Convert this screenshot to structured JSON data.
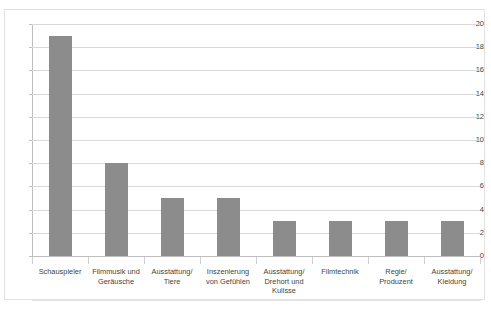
{
  "chart_data": {
    "type": "bar",
    "title": "",
    "xlabel": "",
    "ylabel": "",
    "ylim": [
      0,
      20
    ],
    "yticks": [
      0,
      2,
      4,
      6,
      8,
      10,
      12,
      14,
      16,
      18,
      20
    ],
    "grid": true,
    "legend": false,
    "bar_color": "#8c8c8c",
    "categories": [
      "Schauspieler",
      "Filmmusik und\nGeräusche",
      "Ausstattung/\nTiere",
      "Inszenierung\nvon Gefühlen",
      "Ausstattung/\nDrehort und\nKulisse",
      "Filmtechnik",
      "Regie/\nProduzent",
      "Ausstattung/\nKleidung"
    ],
    "values": [
      19,
      8,
      5,
      5,
      3,
      3,
      3,
      3
    ]
  },
  "ticks": {
    "t0": "0",
    "t1": "2",
    "t2": "4",
    "t3": "6",
    "t4": "8",
    "t5": "10",
    "t6": "12",
    "t7": "14",
    "t8": "16",
    "t9": "18",
    "t10": "20"
  },
  "categories": {
    "c0": "Schauspieler",
    "c1": "Filmmusik und\nGeräusche",
    "c2": "Ausstattung/\nTiere",
    "c3": "Inszenierung\nvon Gefühlen",
    "c4": "Ausstattung/\nDrehort und\nKulisse",
    "c5": "Filmtechnik",
    "c6": "Regie/\nProduzent",
    "c7": "Ausstattung/\nKleidung"
  },
  "clipped_title": ""
}
